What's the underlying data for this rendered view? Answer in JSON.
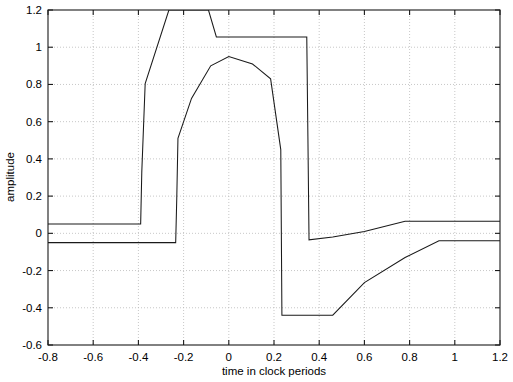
{
  "chart_data": {
    "type": "line",
    "title": "",
    "xlabel": "time in clock periods",
    "ylabel": "amplitude",
    "xlim": [
      -0.8,
      1.2
    ],
    "ylim": [
      -0.6,
      1.2
    ],
    "xticks": [
      -0.8,
      -0.6,
      -0.4,
      -0.2,
      0,
      0.2,
      0.4,
      0.6,
      0.8,
      1,
      1.2
    ],
    "xticklabels": [
      "-0.8",
      "-0.6",
      "-0.4",
      "-0.2",
      "0",
      "0.2",
      "0.4",
      "0.6",
      "0.8",
      "1",
      "1.2"
    ],
    "yticks": [
      -0.6,
      -0.4,
      -0.2,
      0,
      0.2,
      0.4,
      0.6,
      0.8,
      1,
      1.2
    ],
    "yticklabels": [
      "-0.6",
      "-0.4",
      "-0.2",
      "0",
      "0.2",
      "0.4",
      "0.6",
      "0.8",
      "1",
      "1.2"
    ],
    "grid": true,
    "grid_style": "dotted",
    "legend": "none",
    "line_color": "#1a1a1a",
    "background_color": "#ffffff",
    "clipped_above": true,
    "series": [
      {
        "name": "upper-envelope",
        "x": [
          -0.8,
          -0.39,
          -0.385,
          -0.37,
          -0.265,
          -0.165,
          -0.09,
          -0.055,
          0.13,
          0.345,
          0.35,
          0.355,
          0.46,
          0.6,
          0.78,
          1.2
        ],
        "y": [
          0.05,
          0.05,
          0.33,
          0.805,
          1.2,
          1.2,
          1.2,
          1.055,
          1.055,
          1.055,
          0.52,
          -0.035,
          -0.02,
          0.01,
          0.065,
          0.065
        ]
      },
      {
        "name": "lower-envelope",
        "x": [
          -0.8,
          -0.235,
          -0.23,
          -0.225,
          -0.165,
          -0.08,
          0.0,
          0.105,
          0.185,
          0.23,
          0.235,
          0.46,
          0.6,
          0.78,
          0.93,
          1.2
        ],
        "y": [
          -0.05,
          -0.05,
          0.2,
          0.51,
          0.725,
          0.9,
          0.95,
          0.91,
          0.83,
          0.45,
          -0.44,
          -0.44,
          -0.265,
          -0.13,
          -0.04,
          -0.04
        ]
      }
    ],
    "annotations": []
  },
  "figure": {
    "plot_area": {
      "left": 48,
      "top": 10,
      "right": 500,
      "bottom": 345
    }
  }
}
